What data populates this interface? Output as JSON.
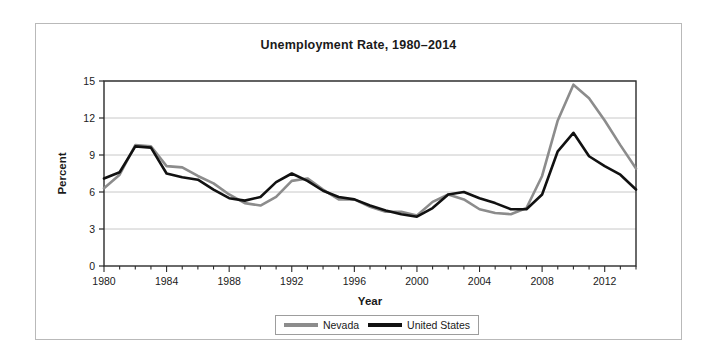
{
  "chart_data": {
    "type": "line",
    "title": "Unemployment Rate, 1980–2014",
    "xlabel": "Year",
    "ylabel": "Percent",
    "xlim": [
      1980,
      2014
    ],
    "ylim": [
      0,
      15
    ],
    "yticks": [
      0,
      3,
      6,
      9,
      12,
      15
    ],
    "xticks": [
      1980,
      1984,
      1988,
      1992,
      1996,
      2000,
      2004,
      2008,
      2012
    ],
    "xtick_labels": [
      "1980",
      "1984",
      "1988",
      "1992",
      "1996",
      "2000",
      "2004",
      "2008",
      "2012"
    ],
    "ytick_labels": [
      "0",
      "3",
      "6",
      "9",
      "12",
      "15"
    ],
    "x_minor_tick_interval": 1,
    "grid": "horizontal",
    "grid_color": "#c8c8c8",
    "legend_position": "bottom-outside",
    "x": [
      1980,
      1981,
      1982,
      1983,
      1984,
      1985,
      1986,
      1987,
      1988,
      1989,
      1990,
      1991,
      1992,
      1993,
      1994,
      1995,
      1996,
      1997,
      1998,
      1999,
      2000,
      2001,
      2002,
      2003,
      2004,
      2005,
      2006,
      2007,
      2008,
      2009,
      2010,
      2011,
      2012,
      2013,
      2014
    ],
    "series": [
      {
        "name": "Nevada",
        "color": "#8c8c8c",
        "values": [
          6.3,
          7.4,
          9.8,
          9.7,
          8.1,
          8.0,
          7.3,
          6.7,
          5.8,
          5.1,
          4.9,
          5.6,
          6.9,
          7.1,
          6.2,
          5.4,
          5.4,
          4.8,
          4.4,
          4.4,
          4.1,
          5.2,
          5.8,
          5.4,
          4.6,
          4.3,
          4.2,
          4.7,
          7.3,
          11.8,
          14.7,
          13.6,
          11.8,
          9.8,
          7.9
        ]
      },
      {
        "name": "United States",
        "color": "#111111",
        "values": [
          7.1,
          7.6,
          9.7,
          9.6,
          7.5,
          7.2,
          7.0,
          6.2,
          5.5,
          5.3,
          5.6,
          6.8,
          7.5,
          6.9,
          6.1,
          5.6,
          5.4,
          4.9,
          4.5,
          4.2,
          4.0,
          4.7,
          5.8,
          6.0,
          5.5,
          5.1,
          4.6,
          4.6,
          5.8,
          9.3,
          10.8,
          8.9,
          8.1,
          7.4,
          6.2
        ]
      }
    ]
  }
}
